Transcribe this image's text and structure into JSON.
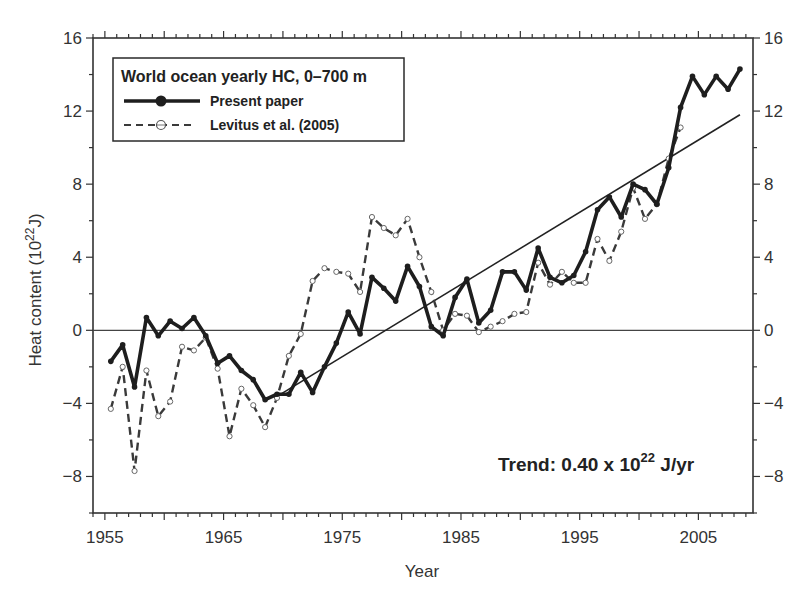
{
  "chart_data": {
    "type": "line",
    "title": "",
    "xlabel": "Year",
    "ylabel": "Heat content (10^22 J)",
    "ylabel_parts": {
      "main": "Heat content (10",
      "sup": "22",
      "unit": "J)"
    },
    "xlim": [
      1954.0,
      2009.6
    ],
    "ylim": [
      -10,
      16
    ],
    "x_ticks": [
      1955,
      1965,
      1975,
      1985,
      1995,
      2005
    ],
    "y_ticks": [
      -8,
      -4,
      0,
      4,
      8,
      12,
      16
    ],
    "y_tick_labels": [
      "−8",
      "−4",
      "0",
      "4",
      "8",
      "12",
      "16"
    ],
    "right_axis_mirror": true,
    "zero_line": true,
    "grid": false,
    "legend": {
      "position": "upper-left",
      "title": "World ocean yearly HC, 0–700 m",
      "entries": [
        "Present paper",
        "Levitus et al. (2005)"
      ]
    },
    "annotation": {
      "prefix": "Trend: 0.40 x 10",
      "sup": "22",
      "suffix": " J/yr"
    },
    "trend_line": {
      "x": [
        1969.3,
        2008.5
      ],
      "y": [
        -3.7,
        11.8
      ],
      "slope_per_year": 0.4
    },
    "x": [
      1955.5,
      1956.5,
      1957.5,
      1958.5,
      1959.5,
      1960.5,
      1961.5,
      1962.5,
      1963.5,
      1964.5,
      1965.5,
      1966.5,
      1967.5,
      1968.5,
      1969.5,
      1970.5,
      1971.5,
      1972.5,
      1973.5,
      1974.5,
      1975.5,
      1976.5,
      1977.5,
      1978.5,
      1979.5,
      1980.5,
      1981.5,
      1982.5,
      1983.5,
      1984.5,
      1985.5,
      1986.5,
      1987.5,
      1988.5,
      1989.5,
      1990.5,
      1991.5,
      1992.5,
      1993.5,
      1994.5,
      1995.5,
      1996.5,
      1997.5,
      1998.5,
      1999.5,
      2000.5,
      2001.5,
      2002.5,
      2003.5,
      2004.5,
      2005.5,
      2006.5,
      2007.5,
      2008.5
    ],
    "series": [
      {
        "name": "Present paper",
        "style": "solid-thick-dots",
        "values": [
          -1.7,
          -0.8,
          -3.1,
          0.7,
          -0.3,
          0.5,
          0.1,
          0.7,
          -0.3,
          -1.8,
          -1.4,
          -2.2,
          -2.7,
          -3.8,
          -3.5,
          -3.5,
          -2.3,
          -3.4,
          -2.0,
          -0.7,
          1.0,
          -0.2,
          2.9,
          2.3,
          1.6,
          3.5,
          2.4,
          0.2,
          -0.3,
          1.8,
          2.8,
          0.4,
          1.1,
          3.2,
          3.2,
          2.2,
          4.5,
          2.9,
          2.6,
          3.0,
          4.3,
          6.6,
          7.3,
          6.2,
          8.0,
          7.7,
          6.9,
          8.9,
          12.2,
          13.9,
          12.9,
          13.9,
          13.2,
          14.3
        ]
      },
      {
        "name": "Levitus et al. (2005)",
        "style": "dashed-open-circles",
        "values": [
          -4.3,
          -2.0,
          -7.7,
          -2.2,
          -4.7,
          -3.9,
          -0.9,
          -1.1,
          -0.4,
          -2.1,
          -5.8,
          -3.2,
          -4.1,
          -5.3,
          -3.7,
          -1.4,
          -0.2,
          2.7,
          3.4,
          3.2,
          3.1,
          2.1,
          6.2,
          5.6,
          5.2,
          6.1,
          4.0,
          2.1,
          0.0,
          0.9,
          0.8,
          -0.1,
          0.2,
          0.5,
          0.9,
          1.0,
          3.7,
          2.5,
          3.2,
          2.6,
          2.6,
          5.0,
          3.8,
          5.4,
          7.8,
          6.1,
          6.9,
          9.4,
          11.1,
          null,
          null,
          null,
          null,
          null
        ]
      }
    ]
  },
  "colors": {
    "present": "#1e1e1e",
    "levitus": "#3a3a3a",
    "axis": "#333333"
  }
}
